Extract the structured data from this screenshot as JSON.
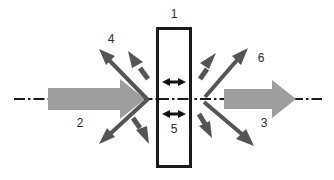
{
  "figure": {
    "type": "optical-beam-splitter-schematic",
    "canvas": {
      "width": 334,
      "height": 180,
      "background": "#ffffff"
    },
    "colors": {
      "beam_gray": "#9e9e9e",
      "scatter_gray": "#666666",
      "outline_black": "#1a1a1a",
      "axis_black": "#1a1a1a",
      "label_text": "#2b2b2b"
    },
    "labels": {
      "plate": "1",
      "incident_beam": "2",
      "transmitted_beam": "3",
      "back_scatter_up": "4",
      "internal_oscillation": "5",
      "forward_scatter_up": "6"
    },
    "elements": {
      "plate_name": "vertical rectangular plate",
      "axis_name": "optical axis dash-dot centerline",
      "incident_name": "incident gray beam arrow pointing right",
      "transmitted_name": "transmitted gray beam arrow pointing right",
      "internal_arrow_upper": "double headed horizontal arrow upper",
      "internal_arrow_lower": "double headed horizontal arrow lower",
      "scatter_arrows": [
        "long scatter arrow up-left",
        "short scatter arrow up-left",
        "long scatter arrow down-left",
        "short scatter arrow down-left",
        "long scatter arrow up-right",
        "short scatter arrow up-right",
        "long scatter arrow down-right",
        "short scatter arrow down-right"
      ]
    }
  }
}
